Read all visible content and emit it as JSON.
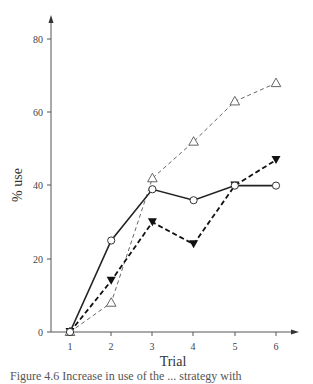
{
  "chart_data": {
    "type": "line",
    "title": "",
    "xlabel": "Trial",
    "ylabel": "% use",
    "x": [
      1,
      2,
      3,
      4,
      5,
      6
    ],
    "xticks": [
      "1",
      "2",
      "3",
      "4",
      "5",
      "6"
    ],
    "yticks": [
      "0",
      "20",
      "40",
      "60",
      "80"
    ],
    "ylim": [
      0,
      80
    ],
    "grid": false,
    "legend": "none",
    "series": [
      {
        "name": "open-circle-solid",
        "marker": "open-circle",
        "line": "solid",
        "values": [
          0,
          25,
          39,
          36,
          40,
          40
        ]
      },
      {
        "name": "filled-triangle-dashed",
        "marker": "filled-inverted-triangle",
        "line": "heavy-dashed",
        "values": [
          0,
          14,
          30,
          24,
          40,
          47
        ]
      },
      {
        "name": "open-triangle-dashed",
        "marker": "open-triangle",
        "line": "thin-dashed",
        "values": [
          0,
          8,
          42,
          52,
          63,
          68
        ]
      }
    ]
  },
  "caption": "Figure 4.6 Increase in use of the ... strategy with"
}
